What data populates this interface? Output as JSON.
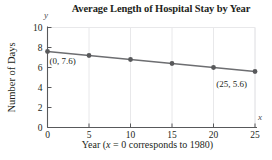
{
  "chart_data": {
    "type": "line",
    "title": "Average Length of Hospital Stay by Year",
    "xlabel": "Year (x = 0 corresponds to 1980)",
    "ylabel": "Number of Days",
    "x": [
      0,
      5,
      10,
      15,
      20,
      25
    ],
    "values": [
      7.6,
      7.2,
      6.8,
      6.4,
      6.0,
      5.6
    ],
    "series": [
      {
        "name": "Average length of stay",
        "values": [
          7.6,
          7.2,
          6.8,
          6.4,
          6.0,
          5.6
        ]
      }
    ],
    "xlim": [
      0,
      25
    ],
    "ylim": [
      0,
      10
    ],
    "xticks": [
      "0",
      "5",
      "10",
      "15",
      "20",
      "25"
    ],
    "yticks": [
      "0",
      "2",
      "4",
      "6",
      "8",
      "10"
    ],
    "grid": true,
    "legend": "none",
    "annotations": [
      {
        "text": "(0, 7.6)",
        "x": 0,
        "y": 7.6
      },
      {
        "text": "(25, 5.6)",
        "x": 25,
        "y": 5.6
      }
    ],
    "axis_letters": {
      "x": "x",
      "y": "y"
    },
    "colors": {
      "line": "#6d6e71",
      "marker": "#58595b",
      "axis": "#58595b",
      "grid": "#e8e8ea",
      "text": "#231f20"
    }
  },
  "xlabel_parts": {
    "lead": "Year (",
    "var": "x",
    "tail": " = 0 corresponds to 1980)"
  }
}
